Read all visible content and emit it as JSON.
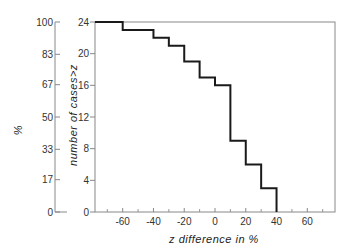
{
  "chart_data": {
    "type": "line",
    "subtype": "step",
    "title": "",
    "xlabel": "z difference in %",
    "ylabel": "number of cases>z",
    "ylabel_secondary": "%",
    "xlim": [
      -78,
      78
    ],
    "ylim": [
      0,
      24
    ],
    "x_ticks": [
      -60,
      -40,
      -20,
      0,
      20,
      40,
      60
    ],
    "x_minor_ticks": [
      -70,
      -50,
      -30,
      -10,
      10,
      30,
      50,
      70
    ],
    "y_ticks": [
      0,
      4,
      8,
      12,
      16,
      20,
      24
    ],
    "y_secondary_ticks": [
      0,
      17,
      33,
      50,
      67,
      83,
      100
    ],
    "grid": false,
    "legend": null,
    "series": [
      {
        "name": "number of cases > z",
        "x": [
          -78,
          -60,
          -40,
          -30,
          -20,
          -10,
          0,
          10,
          20,
          30,
          40
        ],
        "values": [
          24,
          23,
          22,
          21,
          19,
          17,
          16,
          9,
          6,
          3,
          0
        ]
      }
    ]
  }
}
